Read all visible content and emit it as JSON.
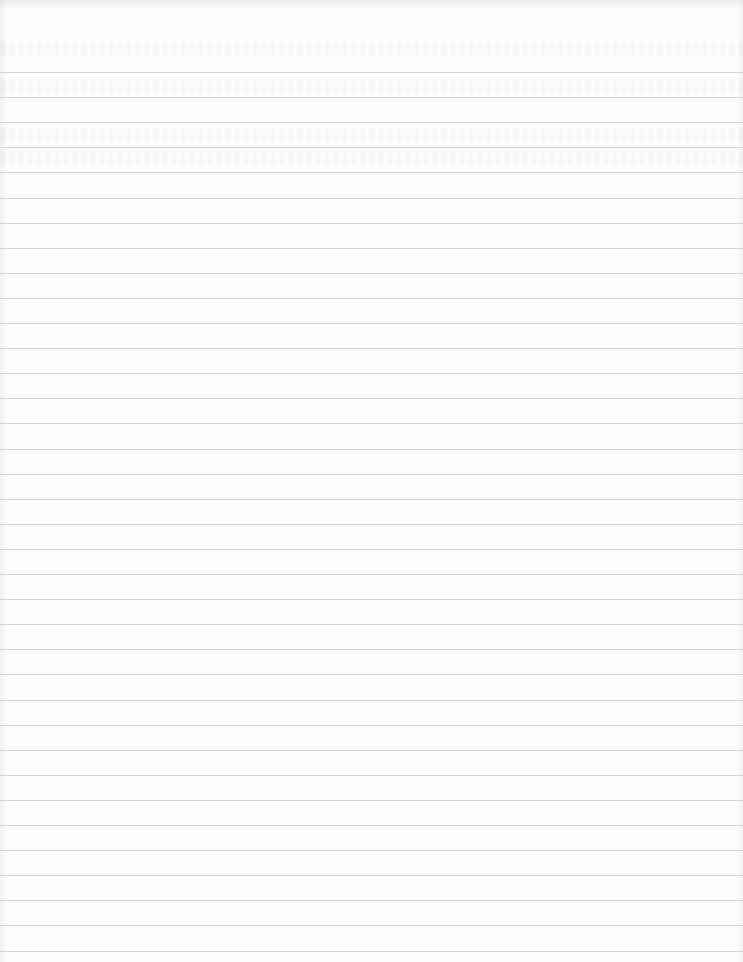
{
  "page": {
    "type": "lined-paper",
    "background_color": "#fdfdfd",
    "rule_color": "#cfcfcf",
    "first_rule_y": 72,
    "rule_spacing_px": 25.1,
    "rule_count": 36,
    "text_content": ""
  }
}
